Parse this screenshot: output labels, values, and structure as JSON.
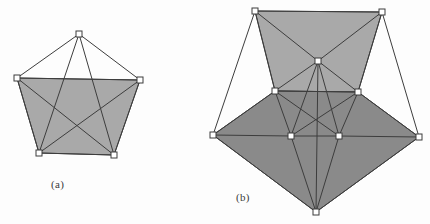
{
  "figure": {
    "background_color": "#fdfdfd",
    "stroke_color": "#3d3d3d",
    "vertex_fill": "#ffffff",
    "fill_light": "#a9a9a9",
    "fill_dark": "#8a8a8a",
    "subfigures": [
      {
        "id": "a",
        "caption": "(a)",
        "description": "quadrilateral-with-apex graph, single shaded face",
        "vertices": [
          {
            "name": "apex",
            "x": 79,
            "y": 34
          },
          {
            "name": "top-left",
            "x": 17,
            "y": 78
          },
          {
            "name": "top-right",
            "x": 140,
            "y": 80
          },
          {
            "name": "bottom-left",
            "x": 39,
            "y": 153
          },
          {
            "name": "bottom-right",
            "x": 114,
            "y": 155
          }
        ],
        "shaded_face": [
          "top-left",
          "top-right",
          "bottom-right",
          "bottom-left"
        ],
        "edges": [
          [
            "apex",
            "top-left"
          ],
          [
            "apex",
            "top-right"
          ],
          [
            "apex",
            "bottom-left"
          ],
          [
            "apex",
            "bottom-right"
          ],
          [
            "top-left",
            "top-right"
          ],
          [
            "top-left",
            "bottom-left"
          ],
          [
            "top-right",
            "bottom-right"
          ],
          [
            "bottom-left",
            "bottom-right"
          ],
          [
            "top-left",
            "bottom-right"
          ],
          [
            "top-right",
            "bottom-left"
          ]
        ]
      },
      {
        "id": "b",
        "caption": "(b)",
        "description": "octahedral-style graph with upper light face and lower dark face",
        "vertices": [
          {
            "name": "top-left",
            "x": 255,
            "y": 11
          },
          {
            "name": "top-right",
            "x": 382,
            "y": 12
          },
          {
            "name": "center",
            "x": 318,
            "y": 61
          },
          {
            "name": "mid-left",
            "x": 275,
            "y": 91
          },
          {
            "name": "mid-right",
            "x": 358,
            "y": 92
          },
          {
            "name": "outer-left",
            "x": 213,
            "y": 135
          },
          {
            "name": "outer-right",
            "x": 419,
            "y": 137
          },
          {
            "name": "low-left",
            "x": 291,
            "y": 136
          },
          {
            "name": "low-right",
            "x": 339,
            "y": 136
          },
          {
            "name": "bottom",
            "x": 316,
            "y": 212
          }
        ],
        "upper_face": [
          "top-left",
          "top-right",
          "mid-right",
          "mid-left"
        ],
        "lower_face": [
          "mid-left",
          "mid-right",
          "outer-right",
          "bottom",
          "outer-left"
        ],
        "edges": [
          [
            "top-left",
            "top-right"
          ],
          [
            "top-left",
            "center"
          ],
          [
            "top-right",
            "center"
          ],
          [
            "top-left",
            "mid-left"
          ],
          [
            "top-right",
            "mid-right"
          ],
          [
            "mid-left",
            "center"
          ],
          [
            "mid-right",
            "center"
          ],
          [
            "mid-left",
            "mid-right"
          ],
          [
            "top-left",
            "outer-left"
          ],
          [
            "top-right",
            "outer-right"
          ],
          [
            "outer-left",
            "mid-left"
          ],
          [
            "outer-right",
            "mid-right"
          ],
          [
            "outer-left",
            "low-left"
          ],
          [
            "outer-right",
            "low-right"
          ],
          [
            "outer-left",
            "bottom"
          ],
          [
            "outer-right",
            "bottom"
          ],
          [
            "mid-left",
            "low-left"
          ],
          [
            "mid-right",
            "low-right"
          ],
          [
            "mid-left",
            "low-right"
          ],
          [
            "mid-right",
            "low-left"
          ],
          [
            "center",
            "low-left"
          ],
          [
            "center",
            "low-right"
          ],
          [
            "low-left",
            "low-right"
          ],
          [
            "low-left",
            "bottom"
          ],
          [
            "low-right",
            "bottom"
          ],
          [
            "center",
            "bottom"
          ]
        ]
      }
    ]
  }
}
